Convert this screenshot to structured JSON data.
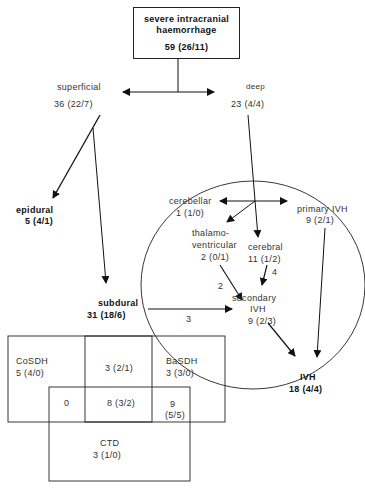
{
  "root": {
    "title_line1": "severe  intracranial",
    "title_line2": "haemorrhage",
    "count": "59    (26/11)"
  },
  "superficial": {
    "label": "superficial",
    "count": "36   (22/7)"
  },
  "deep": {
    "label": "deep",
    "count": "23   (4/4)"
  },
  "epidural": {
    "label": "epidural",
    "count": "5   (4/1)"
  },
  "subdural": {
    "label": "subdural",
    "count": "31    (18/6)"
  },
  "cerebellar": {
    "label": "cerebellar",
    "count": "1   (1/0)"
  },
  "primary_ivh": {
    "label": "primary  IVH",
    "count": "9  (2/1)"
  },
  "thalamoventricular": {
    "label_line1": "thalamo-",
    "label_line2": "ventricular",
    "count": "2  (0/1)"
  },
  "cerebral": {
    "label": "cerebral",
    "count": "11    (1/2)"
  },
  "secondary_ivh": {
    "label_line1": "secondary",
    "label_line2": "IVH",
    "count": "9  (2/3)"
  },
  "ivh": {
    "label": "IVH",
    "count": "18     (4/4)"
  },
  "edge_labels": {
    "thalamo_to_secondary": "2",
    "cerebral_to_secondary": "4",
    "subdural_to_secondary": "3"
  },
  "venn": {
    "cosdh": {
      "label": "CoSDH",
      "count": "5   (4/0)"
    },
    "cosdh_basdh": "3   (2/1)",
    "basdh": {
      "label": "BaSDH",
      "count": "3   (3/0)"
    },
    "cosdh_ctd": "0",
    "all_three": "8 (3/2)",
    "basdh_ctd_line1": "9",
    "basdh_ctd_line2": "(5/5)",
    "ctd": {
      "label": "CTD",
      "count": "3   (1/0)"
    }
  }
}
